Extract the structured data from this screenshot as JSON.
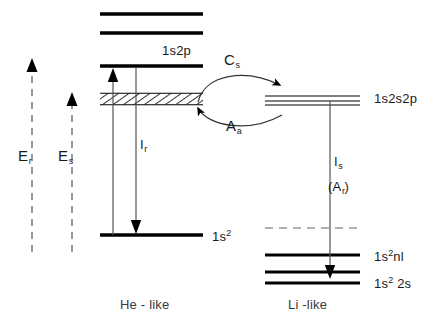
{
  "figure": {
    "width": 447,
    "height": 333,
    "background": "#ffffff",
    "line_color": "#000000",
    "thin_line_color": "#555555",
    "dashed_color": "#999999"
  },
  "energy_axes": [
    {
      "id": "Er",
      "label": "E",
      "sub": "r",
      "description": "resonance excitation energy axis, dashed upward arrow",
      "x": 32,
      "top": 62,
      "bottom": 252
    },
    {
      "id": "Es",
      "label": "E",
      "sub": "s",
      "description": "satellite excitation energy axis, dashed upward arrow",
      "x": 72,
      "top": 96,
      "bottom": 252
    }
  ],
  "he_like": {
    "caption": "He - like",
    "levels": [
      {
        "id": "upper-1",
        "label": "",
        "y": 14,
        "x1": 100,
        "x2": 203,
        "weight": "thick"
      },
      {
        "id": "upper-2",
        "label": "",
        "y": 33,
        "x1": 100,
        "x2": 203,
        "weight": "thick"
      },
      {
        "id": "1s2p",
        "label": "1s2p",
        "y": 66,
        "x1": 100,
        "x2": 203,
        "weight": "thick"
      },
      {
        "id": "autoionizing",
        "label": "",
        "y": 99,
        "x1": 100,
        "x2": 203,
        "weight": "hatched"
      },
      {
        "id": "ground",
        "label": "1s<sup>2</sup>",
        "label_text": "1s2",
        "y": 235,
        "x1": 100,
        "x2": 203,
        "weight": "thick"
      }
    ],
    "level_labels": {
      "excited_1s2p": "1s2p",
      "ground": "1s",
      "ground_sup": "2"
    },
    "transitions": [
      {
        "id": "Er-excitation",
        "label": "",
        "direction": "up",
        "x": 113,
        "from_y": 235,
        "to_y": 68
      },
      {
        "id": "Ir-emission",
        "label": "I",
        "sub": "r",
        "direction": "down",
        "x": 136,
        "from_y": 67,
        "to_y": 233
      }
    ]
  },
  "li_like": {
    "caption": "Li -like",
    "levels": [
      {
        "id": "1s2s2p",
        "label": "1s2s2p",
        "y": 99,
        "x1": 265,
        "x2": 360,
        "weight": "manifold",
        "line_count": 3
      },
      {
        "id": "ionization-limit",
        "label": "",
        "y": 228,
        "x1": 265,
        "x2": 360,
        "weight": "dashed"
      },
      {
        "id": "1s2nl",
        "label": "1s<sup>2</sup>nl",
        "label_text": "1s2nl",
        "y": 255,
        "x1": 265,
        "x2": 360,
        "weight": "thick"
      },
      {
        "id": "1s2-2s-upper",
        "label": "",
        "y": 272,
        "x1": 265,
        "x2": 360,
        "weight": "thick"
      },
      {
        "id": "1s2-2s",
        "label": "1s<sup>2</sup> 2s",
        "label_text": "1s2 2s",
        "y": 283,
        "x1": 265,
        "x2": 360,
        "weight": "thick"
      }
    ],
    "level_labels": {
      "autoionizing_state": "1s2s2p",
      "excited_nl": "1s",
      "excited_nl_sup": "2",
      "excited_nl_tail": "nl",
      "ground": "1s",
      "ground_sup": "2",
      "ground_tail": " 2s"
    },
    "transitions": [
      {
        "id": "Is-emission",
        "label": "I",
        "sub": "s",
        "alt_label": "(A",
        "alt_sub": "r",
        "alt_label_tail": ")",
        "direction": "down",
        "x": 330,
        "from_y": 101,
        "to_y": 278
      }
    ]
  },
  "process_arrows": [
    {
      "id": "capture",
      "label": "C",
      "sub": "s",
      "description": "dielectronic capture, curved arrow from He-like autoionizing band to Li-like 1s2s2p",
      "direction": "right",
      "label_x": 224,
      "label_y": 59
    },
    {
      "id": "autoionization",
      "label": "A",
      "sub": "a",
      "description": "autoionization, curved arrow from Li-like 1s2s2p back to He-like band",
      "direction": "left",
      "label_x": 226,
      "label_y": 118
    }
  ],
  "captions": {
    "left": "He - like",
    "right": "Li -like",
    "left_x": 120,
    "right_x": 288,
    "y": 304
  }
}
